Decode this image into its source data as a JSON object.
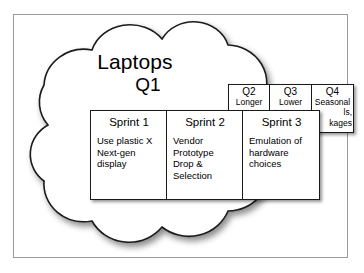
{
  "diagram": {
    "cloud_label": {
      "main": "Laptops",
      "sub": "Q1"
    },
    "quarters": [
      {
        "label": "Q2",
        "note": "Longer",
        "extra": ""
      },
      {
        "label": "Q3",
        "note": "Lower",
        "extra": ""
      },
      {
        "label": "Q4",
        "note": "Seasonal",
        "extra_line1": "ls,",
        "extra_line2": "kages"
      }
    ],
    "sprints": [
      {
        "title": "Sprint 1",
        "lines": [
          "Use plastic X",
          "Next-gen",
          "display"
        ]
      },
      {
        "title": "Sprint 2",
        "lines": [
          "Vendor",
          "Prototype",
          "Drop &",
          "Selection"
        ]
      },
      {
        "title": "Sprint 3",
        "lines": [
          "Emulation of",
          "hardware",
          "choices"
        ]
      }
    ]
  },
  "colors": {
    "outline": "#1a1a1a",
    "frame": "#9a9a9a",
    "background": "#ffffff"
  }
}
